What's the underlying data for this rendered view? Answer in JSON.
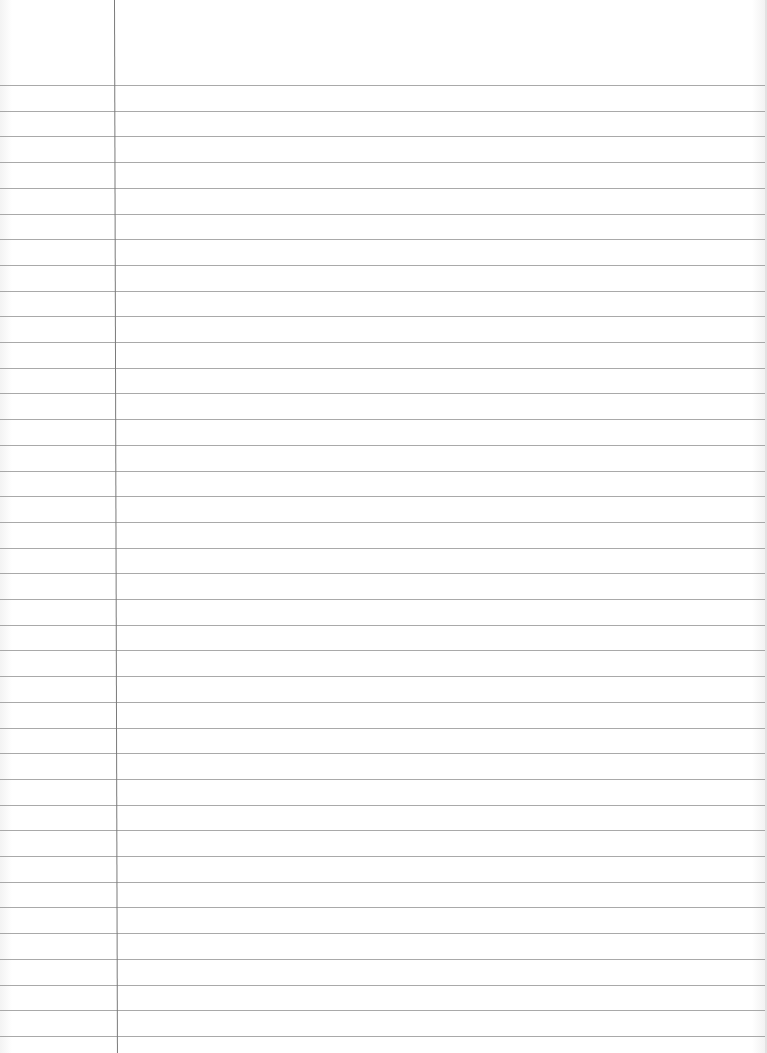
{
  "page": {
    "type": "lined-notebook-paper",
    "background_color": "#ffffff",
    "rule_color": "#9a9a9a",
    "margin_line_color": "#7a7a7a",
    "first_rule_y": 85,
    "rule_spacing": 25.7,
    "rule_count": 38,
    "margin_line_x": 114,
    "content": ""
  }
}
